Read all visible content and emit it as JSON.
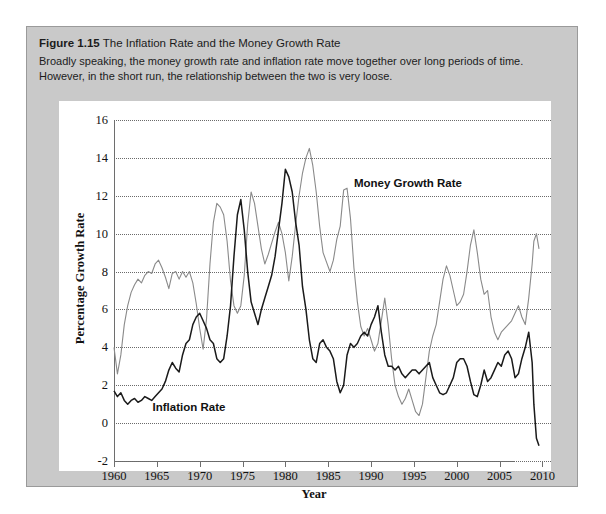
{
  "figure": {
    "number": "Figure 1.15",
    "title": "The Inflation Rate and the Money Growth Rate",
    "caption": "Broadly speaking, the money growth rate and inflation rate move together over long periods of time. However, in the short run, the relationship between the two is very loose."
  },
  "chart_data": {
    "type": "line",
    "title": "The Inflation Rate and the Money Growth Rate",
    "xlabel": "Year",
    "ylabel": "Percentage Growth Rate",
    "xlim": [
      1960,
      2011
    ],
    "ylim": [
      -2,
      16
    ],
    "xticks": [
      1960,
      1965,
      1970,
      1975,
      1980,
      1985,
      1990,
      1995,
      2000,
      2005,
      2010
    ],
    "yticks": [
      -2,
      0,
      2,
      4,
      6,
      8,
      10,
      12,
      14,
      16
    ],
    "grid": "horizontal-dotted",
    "legend": "inline-annotations",
    "colors": {
      "money_growth": "#8a8a8a",
      "inflation": "#1a1a1a",
      "gridline": "#6a6a6a",
      "axis": "#6e6e6e",
      "card_background": "#c9c9c9",
      "plot_background": "#ffffff"
    },
    "series": [
      {
        "name": "Money Growth Rate",
        "color": "#8a8a8a",
        "label_position": {
          "x": 1988,
          "y": 12.6
        },
        "x": [
          1960.0,
          1960.4,
          1960.8,
          1961.2,
          1961.6,
          1962.0,
          1962.4,
          1962.8,
          1963.2,
          1963.6,
          1964.0,
          1964.4,
          1964.8,
          1965.2,
          1965.6,
          1966.0,
          1966.4,
          1966.8,
          1967.2,
          1967.6,
          1968.0,
          1968.4,
          1968.8,
          1969.2,
          1969.6,
          1970.0,
          1970.4,
          1970.8,
          1971.2,
          1971.6,
          1972.0,
          1972.4,
          1972.8,
          1973.2,
          1973.6,
          1974.0,
          1974.4,
          1974.8,
          1975.2,
          1975.6,
          1976.0,
          1976.4,
          1976.8,
          1977.2,
          1977.6,
          1978.0,
          1978.4,
          1978.8,
          1979.2,
          1979.6,
          1980.0,
          1980.4,
          1980.8,
          1981.2,
          1981.6,
          1982.0,
          1982.4,
          1982.8,
          1983.2,
          1983.6,
          1984.0,
          1984.4,
          1984.8,
          1985.2,
          1985.6,
          1986.0,
          1986.4,
          1986.8,
          1987.2,
          1987.6,
          1988.0,
          1988.4,
          1988.8,
          1989.2,
          1989.6,
          1990.0,
          1990.4,
          1990.8,
          1991.2,
          1991.6,
          1992.0,
          1992.4,
          1992.8,
          1993.2,
          1993.6,
          1994.0,
          1994.4,
          1994.8,
          1995.2,
          1995.6,
          1996.0,
          1996.4,
          1996.8,
          1997.2,
          1997.6,
          1998.0,
          1998.4,
          1998.8,
          1999.2,
          1999.6,
          2000.0,
          2000.4,
          2000.8,
          2001.2,
          2001.6,
          2002.0,
          2002.4,
          2002.8,
          2003.2,
          2003.6,
          2004.0,
          2004.4,
          2004.8,
          2005.2,
          2005.6,
          2006.0,
          2006.4,
          2006.8,
          2007.2,
          2007.6,
          2008.0,
          2008.4,
          2008.8,
          2009.0,
          2009.3,
          2009.6
        ],
        "y": [
          4.0,
          2.6,
          3.6,
          5.2,
          6.2,
          6.9,
          7.3,
          7.6,
          7.4,
          7.8,
          8.0,
          7.9,
          8.4,
          8.6,
          8.2,
          7.7,
          7.1,
          7.9,
          8.0,
          7.6,
          8.0,
          7.7,
          8.0,
          7.4,
          6.3,
          5.0,
          3.9,
          5.5,
          8.4,
          10.6,
          11.6,
          11.4,
          11.0,
          9.6,
          7.5,
          6.2,
          5.8,
          6.2,
          7.8,
          10.5,
          12.2,
          11.6,
          10.4,
          9.2,
          8.4,
          8.9,
          9.5,
          10.1,
          10.6,
          10.0,
          9.0,
          7.5,
          8.8,
          10.5,
          12.0,
          13.2,
          14.0,
          14.5,
          13.6,
          12.2,
          10.4,
          9.0,
          8.5,
          8.0,
          8.6,
          9.7,
          10.4,
          12.3,
          12.4,
          10.8,
          8.2,
          6.4,
          5.1,
          4.6,
          5.0,
          4.4,
          3.8,
          4.2,
          5.4,
          6.6,
          5.2,
          3.4,
          2.0,
          1.4,
          1.0,
          1.3,
          1.8,
          1.2,
          0.6,
          0.4,
          1.0,
          2.4,
          3.8,
          4.6,
          5.2,
          6.4,
          7.6,
          8.3,
          7.8,
          7.0,
          6.2,
          6.4,
          6.8,
          8.0,
          9.4,
          10.2,
          9.0,
          7.6,
          6.8,
          7.0,
          5.6,
          4.8,
          4.4,
          4.8,
          5.0,
          5.2,
          5.4,
          5.8,
          6.2,
          5.6,
          5.2,
          6.6,
          8.4,
          9.6,
          10.0,
          9.2
        ]
      },
      {
        "name": "Inflation Rate",
        "color": "#1a1a1a",
        "label_position": {
          "x": 1964.5,
          "y": 0.8
        },
        "x": [
          1960.0,
          1960.4,
          1960.8,
          1961.2,
          1961.6,
          1962.0,
          1962.4,
          1962.8,
          1963.2,
          1963.6,
          1964.0,
          1964.4,
          1964.8,
          1965.2,
          1965.6,
          1966.0,
          1966.4,
          1966.8,
          1967.2,
          1967.6,
          1968.0,
          1968.4,
          1968.8,
          1969.2,
          1969.6,
          1970.0,
          1970.4,
          1970.8,
          1971.2,
          1971.6,
          1972.0,
          1972.4,
          1972.8,
          1973.2,
          1973.6,
          1974.0,
          1974.4,
          1974.8,
          1975.2,
          1975.6,
          1976.0,
          1976.4,
          1976.8,
          1977.2,
          1977.6,
          1978.0,
          1978.4,
          1978.8,
          1979.2,
          1979.6,
          1980.0,
          1980.4,
          1980.8,
          1981.2,
          1981.6,
          1982.0,
          1982.4,
          1982.8,
          1983.2,
          1983.6,
          1984.0,
          1984.4,
          1984.8,
          1985.2,
          1985.6,
          1986.0,
          1986.4,
          1986.8,
          1987.2,
          1987.6,
          1988.0,
          1988.4,
          1988.8,
          1989.2,
          1989.6,
          1990.0,
          1990.4,
          1990.8,
          1991.2,
          1991.6,
          1992.0,
          1992.4,
          1992.8,
          1993.2,
          1993.6,
          1994.0,
          1994.4,
          1994.8,
          1995.2,
          1995.6,
          1996.0,
          1996.4,
          1996.8,
          1997.2,
          1997.6,
          1998.0,
          1998.4,
          1998.8,
          1999.2,
          1999.6,
          2000.0,
          2000.4,
          2000.8,
          2001.2,
          2001.6,
          2002.0,
          2002.4,
          2002.8,
          2003.2,
          2003.6,
          2004.0,
          2004.4,
          2004.8,
          2005.2,
          2005.6,
          2006.0,
          2006.4,
          2006.8,
          2007.2,
          2007.6,
          2008.0,
          2008.4,
          2008.8,
          2009.0,
          2009.3,
          2009.6
        ],
        "y": [
          1.7,
          1.4,
          1.6,
          1.2,
          1.0,
          1.2,
          1.3,
          1.1,
          1.2,
          1.4,
          1.3,
          1.2,
          1.4,
          1.6,
          1.8,
          2.2,
          2.8,
          3.2,
          2.9,
          2.7,
          3.6,
          4.2,
          4.4,
          5.2,
          5.6,
          5.8,
          5.4,
          5.0,
          4.4,
          4.2,
          3.4,
          3.2,
          3.4,
          4.6,
          6.2,
          8.8,
          11.0,
          11.8,
          10.2,
          8.0,
          6.4,
          5.8,
          5.2,
          6.0,
          6.6,
          7.2,
          7.8,
          8.8,
          10.2,
          11.6,
          13.4,
          13.0,
          12.2,
          10.6,
          9.4,
          7.2,
          6.0,
          4.4,
          3.4,
          3.2,
          4.2,
          4.4,
          4.0,
          3.8,
          3.4,
          2.2,
          1.6,
          2.0,
          3.6,
          4.2,
          4.0,
          4.2,
          4.6,
          4.8,
          4.6,
          5.2,
          5.6,
          6.2,
          4.8,
          3.6,
          3.0,
          3.0,
          2.8,
          3.0,
          2.6,
          2.4,
          2.6,
          2.8,
          2.8,
          2.6,
          2.8,
          3.0,
          3.2,
          2.4,
          2.0,
          1.6,
          1.5,
          1.6,
          2.0,
          2.4,
          3.2,
          3.4,
          3.4,
          3.0,
          2.2,
          1.5,
          1.4,
          2.0,
          2.8,
          2.2,
          2.4,
          2.8,
          3.2,
          3.0,
          3.6,
          3.8,
          3.4,
          2.4,
          2.6,
          3.4,
          4.0,
          4.8,
          3.2,
          1.0,
          -0.8,
          -1.2
        ]
      }
    ]
  }
}
